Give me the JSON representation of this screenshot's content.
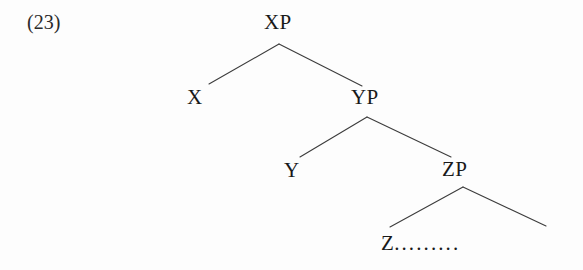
{
  "figure": {
    "example_number": "(23)",
    "type": "syntax-tree",
    "background_color": "#fdfdfd",
    "line_color": "#3c3c3c",
    "text_color": "#191919"
  },
  "tree": {
    "nodes": [
      {
        "id": "xp",
        "label": "XP",
        "x": 279,
        "y": 22
      },
      {
        "id": "x",
        "label": "X",
        "x": 195,
        "y": 97
      },
      {
        "id": "yp",
        "label": "YP",
        "x": 367,
        "y": 97
      },
      {
        "id": "y",
        "label": "Y",
        "x": 292,
        "y": 170
      },
      {
        "id": "zp",
        "label": "ZP",
        "x": 457,
        "y": 169
      },
      {
        "id": "z",
        "label": "Z",
        "x": 388,
        "y": 243
      }
    ],
    "terminal_text": "Z .........",
    "terminal_letter": "Z",
    "terminal_ellipsis": ".........",
    "edges": [
      {
        "from": "xp",
        "to": "x",
        "x1": 279,
        "y1": 44,
        "x2": 209,
        "y2": 84
      },
      {
        "from": "xp",
        "to": "yp",
        "x1": 279,
        "y1": 44,
        "x2": 362,
        "y2": 86
      },
      {
        "from": "yp",
        "to": "y",
        "x1": 367,
        "y1": 117,
        "x2": 300,
        "y2": 157
      },
      {
        "from": "yp",
        "to": "zp",
        "x1": 367,
        "y1": 117,
        "x2": 451,
        "y2": 157
      },
      {
        "from": "zp",
        "to": "z",
        "x1": 463,
        "y1": 187,
        "x2": 390,
        "y2": 227
      },
      {
        "from": "zp",
        "to": "open",
        "x1": 463,
        "y1": 187,
        "x2": 546,
        "y2": 226
      }
    ]
  }
}
